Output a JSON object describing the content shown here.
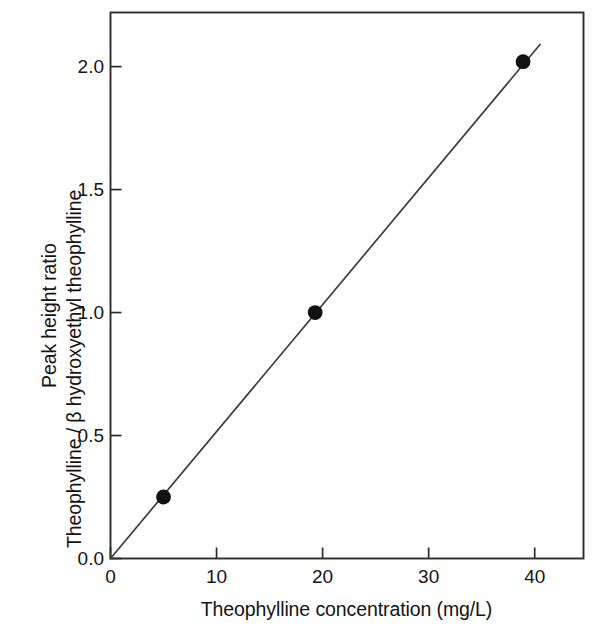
{
  "chart_data": {
    "type": "scatter",
    "title": "",
    "subtitle": "",
    "xlabel": "Theophylline concentration (mg/L)",
    "ylabel_line1": "Peak height ratio",
    "ylabel_line2": "Theophylline / β hydroxyethyl theophylline",
    "xlim": [
      0,
      44.6
    ],
    "ylim": [
      0.0,
      2.22
    ],
    "xticks": [
      0,
      10,
      20,
      30,
      40
    ],
    "xtick_labels": [
      "0",
      "10",
      "20",
      "30",
      "40"
    ],
    "yticks": [
      0.0,
      0.5,
      1.0,
      1.5,
      2.0
    ],
    "ytick_labels": [
      "0.0",
      "0.5",
      "1.0",
      "1.5",
      "2.0"
    ],
    "grid": false,
    "legend": false,
    "tick_direction": "in",
    "frame": "box",
    "series": [
      {
        "name": "Calibration curve",
        "marker": "filled-circle",
        "marker_color": "#111111",
        "line_color": "#3c3c3c",
        "x": [
          5.0,
          19.3,
          38.9
        ],
        "y": [
          0.25,
          1.0,
          2.02
        ]
      }
    ],
    "fit_line": {
      "name": "Least-squares fit through origin",
      "x_start": 0.0,
      "y_start": 0.0,
      "x_end": 40.5,
      "y_end": 2.09,
      "slope": 0.0517,
      "intercept": 0.0,
      "color": "#3c3c3c"
    }
  },
  "colors": {
    "background": "#ffffff",
    "axis": "#2b2b2b",
    "text": "#141414",
    "marker": "#111111",
    "line": "#3c3c3c"
  }
}
